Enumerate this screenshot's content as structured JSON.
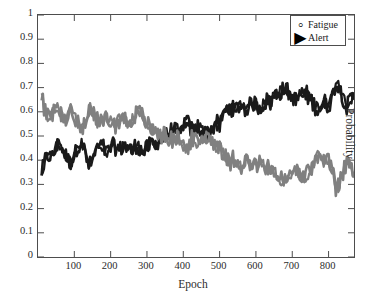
{
  "chart_data": {
    "type": "line",
    "title": "",
    "xlabel": "Epoch",
    "ylabel": "Probability",
    "xlim": [
      0,
      870
    ],
    "ylim": [
      0,
      1
    ],
    "grid": false,
    "legend_position": "top-right",
    "x_ticks": [
      100,
      200,
      300,
      400,
      500,
      600,
      700,
      800
    ],
    "y_ticks": [
      0,
      0.1,
      0.2,
      0.3,
      0.4,
      0.5,
      0.6,
      0.7,
      0.8,
      0.9,
      1
    ],
    "x_tick_labels": [
      "100",
      "200",
      "300",
      "400",
      "500",
      "600",
      "700",
      "800"
    ],
    "y_tick_labels": [
      "0",
      "0.1",
      "0.2",
      "0.3",
      "0.4",
      "0.5",
      "0.6",
      "0.7",
      "0.8",
      "0.9",
      "1"
    ],
    "series": [
      {
        "name": "Fatigue",
        "color": "#1a1a1a",
        "marker": "circle",
        "x": [
          10,
          20,
          30,
          40,
          50,
          60,
          70,
          80,
          90,
          100,
          110,
          120,
          130,
          140,
          150,
          160,
          170,
          180,
          190,
          200,
          210,
          220,
          230,
          240,
          250,
          260,
          270,
          280,
          290,
          300,
          310,
          320,
          330,
          340,
          350,
          360,
          370,
          380,
          390,
          400,
          410,
          420,
          430,
          440,
          450,
          460,
          470,
          480,
          490,
          500,
          510,
          520,
          530,
          540,
          550,
          560,
          570,
          580,
          590,
          600,
          610,
          620,
          630,
          640,
          650,
          660,
          670,
          680,
          690,
          700,
          710,
          720,
          730,
          740,
          750,
          760,
          770,
          780,
          790,
          800,
          810,
          820,
          830,
          840,
          850,
          860,
          870
        ],
        "values": [
          0.35,
          0.4,
          0.42,
          0.41,
          0.45,
          0.47,
          0.44,
          0.41,
          0.39,
          0.42,
          0.46,
          0.48,
          0.43,
          0.38,
          0.4,
          0.44,
          0.46,
          0.45,
          0.43,
          0.45,
          0.46,
          0.44,
          0.45,
          0.46,
          0.45,
          0.44,
          0.46,
          0.45,
          0.43,
          0.45,
          0.47,
          0.46,
          0.48,
          0.5,
          0.49,
          0.51,
          0.53,
          0.52,
          0.5,
          0.55,
          0.56,
          0.53,
          0.52,
          0.54,
          0.53,
          0.51,
          0.52,
          0.53,
          0.55,
          0.54,
          0.58,
          0.61,
          0.62,
          0.6,
          0.62,
          0.63,
          0.61,
          0.62,
          0.64,
          0.63,
          0.62,
          0.63,
          0.65,
          0.64,
          0.66,
          0.68,
          0.69,
          0.7,
          0.68,
          0.66,
          0.65,
          0.67,
          0.68,
          0.67,
          0.65,
          0.63,
          0.61,
          0.63,
          0.64,
          0.62,
          0.66,
          0.72,
          0.7,
          0.66,
          0.62,
          0.65,
          0.66
        ]
      },
      {
        "name": "Alert",
        "color": "#808080",
        "marker": "triangle-right",
        "x": [
          10,
          20,
          30,
          40,
          50,
          60,
          70,
          80,
          90,
          100,
          110,
          120,
          130,
          140,
          150,
          160,
          170,
          180,
          190,
          200,
          210,
          220,
          230,
          240,
          250,
          260,
          270,
          280,
          290,
          300,
          310,
          320,
          330,
          340,
          350,
          360,
          370,
          380,
          390,
          400,
          410,
          420,
          430,
          440,
          450,
          460,
          470,
          480,
          490,
          500,
          510,
          520,
          530,
          540,
          550,
          560,
          570,
          580,
          590,
          600,
          610,
          620,
          630,
          640,
          650,
          660,
          670,
          680,
          690,
          700,
          710,
          720,
          730,
          740,
          750,
          760,
          770,
          780,
          790,
          800,
          810,
          820,
          830,
          840,
          850,
          860,
          870
        ],
        "values": [
          0.66,
          0.6,
          0.58,
          0.59,
          0.62,
          0.6,
          0.56,
          0.58,
          0.61,
          0.59,
          0.55,
          0.53,
          0.57,
          0.62,
          0.6,
          0.56,
          0.55,
          0.56,
          0.58,
          0.56,
          0.54,
          0.56,
          0.58,
          0.57,
          0.55,
          0.57,
          0.59,
          0.6,
          0.58,
          0.55,
          0.53,
          0.52,
          0.51,
          0.5,
          0.51,
          0.49,
          0.48,
          0.49,
          0.5,
          0.46,
          0.45,
          0.48,
          0.49,
          0.47,
          0.48,
          0.5,
          0.49,
          0.48,
          0.46,
          0.47,
          0.43,
          0.4,
          0.39,
          0.41,
          0.39,
          0.38,
          0.4,
          0.39,
          0.37,
          0.38,
          0.39,
          0.38,
          0.36,
          0.37,
          0.35,
          0.33,
          0.32,
          0.31,
          0.33,
          0.35,
          0.36,
          0.34,
          0.33,
          0.34,
          0.36,
          0.38,
          0.42,
          0.4,
          0.38,
          0.4,
          0.36,
          0.28,
          0.3,
          0.35,
          0.4,
          0.37,
          0.35
        ]
      }
    ]
  },
  "legend": {
    "items": [
      {
        "label": "Fatigue",
        "marker": "◦"
      },
      {
        "label": "Alert",
        "marker": "▶"
      }
    ]
  },
  "axes": {
    "x_title": "Epoch",
    "y_title": "Probability"
  }
}
